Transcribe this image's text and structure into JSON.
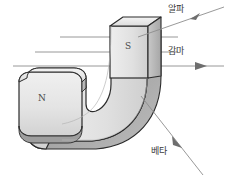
{
  "diagram": {
    "canvas": {
      "width": 230,
      "height": 179,
      "background": "#ffffff"
    },
    "magnet": {
      "type": "horseshoe-magnet",
      "poles": [
        {
          "id": "north",
          "label": "N",
          "x": 41,
          "y": 98,
          "arm": "left-horizontal"
        },
        {
          "id": "south",
          "label": "S",
          "x": 127,
          "y": 46,
          "arm": "upper-vertical"
        }
      ],
      "colors": {
        "face": "#e2e2e2",
        "face_light": "#ededed",
        "edge_dark": "#a9a9a9",
        "edge_mid": "#c6c6c6",
        "outline": "#2b2b2b",
        "shadow": "#9a9a9a"
      }
    },
    "rays": {
      "incoming": [
        {
          "id": "ray-top",
          "x1": 60,
          "y1": 37,
          "x2": 176,
          "y2": 37
        },
        {
          "id": "ray-middle",
          "x1": 35,
          "y1": 52,
          "x2": 176,
          "y2": 52
        },
        {
          "id": "ray-bottom",
          "x1": 13,
          "y1": 66,
          "x2": 176,
          "y2": 66
        }
      ],
      "color": "#8d8d8d"
    },
    "emissions": [
      {
        "id": "alpha",
        "label": "알파",
        "label_x": 168,
        "label_y": 6,
        "path": {
          "x1": 140,
          "y1": 36,
          "x2": 222,
          "y2": 8
        },
        "arrow_x": 197,
        "arrow_y": 17,
        "direction": "up-right",
        "deflection": "upward"
      },
      {
        "id": "gamma",
        "label": "감마",
        "label_x": 168,
        "label_y": 48,
        "path": {
          "x1": 13,
          "y1": 66,
          "x2": 224,
          "y2": 66
        },
        "arrow_x": 202,
        "arrow_y": 66,
        "direction": "straight-right",
        "deflection": "none"
      },
      {
        "id": "beta",
        "label": "베타",
        "label_x": 152,
        "label_y": 148,
        "path": {
          "x1": 140,
          "y1": 96,
          "x2": 200,
          "y2": 172
        },
        "arrow_x": 178,
        "arrow_y": 144,
        "direction": "down-right",
        "deflection": "downward"
      }
    ]
  }
}
